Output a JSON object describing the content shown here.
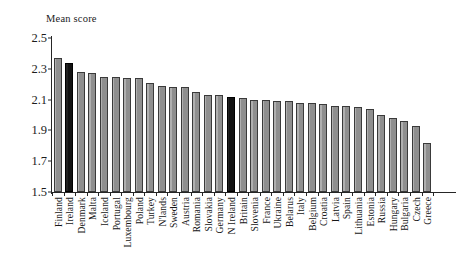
{
  "chart_data": {
    "type": "bar",
    "title": "",
    "ylabel": "Mean score",
    "xlabel": "",
    "ylim": [
      1.5,
      2.5
    ],
    "yticks": [
      2.5,
      2.3,
      2.1,
      1.9,
      1.7,
      1.5
    ],
    "ytick_labels": [
      "2.5",
      "2.3",
      "2.1",
      "1.9",
      "1.7",
      "1.5"
    ],
    "grid": false,
    "legend": null,
    "highlight_color": "#121212",
    "bar_color": "#8f8f8f",
    "highlighted_categories": [
      "Ireland",
      "N Ireland"
    ],
    "categories": [
      "Finland",
      "Ireland",
      "Denmark",
      "Malta",
      "Iceland",
      "Portugal",
      "Luxembourg",
      "Poland",
      "Turkey",
      "N'lands",
      "Sweden",
      "Austria",
      "Romania",
      "Slovakia",
      "Germany",
      "N Ireland",
      "Britain",
      "Slovenia",
      "France",
      "Ukraine",
      "Belarus",
      "Italy",
      "Belgium",
      "Croatia",
      "Latvia",
      "Spain",
      "Lithuania",
      "Estonia",
      "Russia",
      "Hungary",
      "Bulgaria",
      "Czech",
      "Greece"
    ],
    "values": [
      2.37,
      2.34,
      2.28,
      2.27,
      2.25,
      2.25,
      2.24,
      2.24,
      2.21,
      2.19,
      2.18,
      2.18,
      2.15,
      2.13,
      2.13,
      2.12,
      2.11,
      2.1,
      2.1,
      2.09,
      2.09,
      2.08,
      2.08,
      2.07,
      2.06,
      2.06,
      2.05,
      2.04,
      2.0,
      1.98,
      1.96,
      1.93,
      1.82
    ]
  }
}
